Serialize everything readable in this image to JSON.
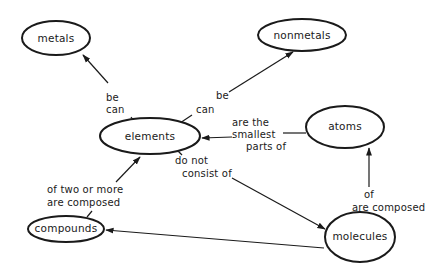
{
  "diagram": {
    "type": "concept-map",
    "background": "#ffffff",
    "stroke_color": "#1a1a1a",
    "nodes": {
      "metals": {
        "label": "metals"
      },
      "nonmetals": {
        "label": "nonmetals"
      },
      "elements": {
        "label": "elements"
      },
      "atoms": {
        "label": "atoms"
      },
      "compounds": {
        "label": "compounds"
      },
      "molecules": {
        "label": "molecules"
      }
    },
    "edges": {
      "elements_metals": {
        "from": "elements",
        "to": "metals",
        "label_lines": [
          "be",
          "can"
        ]
      },
      "elements_nonmetals": {
        "from": "elements",
        "to": "nonmetals",
        "label_lines": [
          "be",
          "can"
        ]
      },
      "atoms_elements": {
        "from": "atoms",
        "to": "elements",
        "label_lines": [
          "are the",
          "smallest",
          "parts of"
        ]
      },
      "elements_molecules": {
        "from": "elements",
        "to": "molecules",
        "label_lines": [
          "do not",
          "consist of"
        ]
      },
      "compounds_elements": {
        "from": "compounds",
        "to": "elements",
        "label_lines": [
          "of two or more",
          "are composed"
        ]
      },
      "molecules_atoms": {
        "from": "molecules",
        "to": "atoms",
        "label_lines": [
          "of",
          "are composed"
        ]
      },
      "molecules_compounds": {
        "from": "molecules",
        "to": "compounds",
        "label_lines": []
      }
    }
  }
}
